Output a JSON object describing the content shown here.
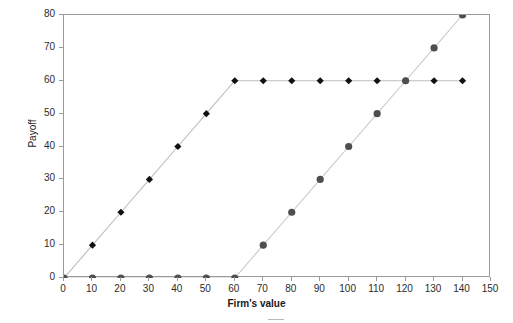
{
  "chart_data": {
    "type": "line",
    "title": "",
    "xlabel": "Firm's value",
    "ylabel": "Payoff",
    "xlim": [
      0,
      150
    ],
    "ylim": [
      0,
      80
    ],
    "xticks": [
      0,
      10,
      20,
      30,
      40,
      50,
      60,
      70,
      80,
      90,
      100,
      110,
      120,
      130,
      140,
      150
    ],
    "yticks": [
      0,
      10,
      20,
      30,
      40,
      50,
      60,
      70,
      80
    ],
    "xtick_labels": [
      "0",
      "10",
      "20",
      "30",
      "40",
      "50",
      "60",
      "70",
      "80",
      "90",
      "100",
      "110",
      "120",
      "130",
      "140",
      "150"
    ],
    "ytick_labels": [
      "0",
      "10",
      "20",
      "30",
      "40",
      "50",
      "60",
      "70",
      "80"
    ],
    "grid": false,
    "legend_position": "bottom",
    "series": [
      {
        "name": "Debt payoff",
        "marker": "diamond",
        "marker_color": "#111111",
        "line_color": "#bdbdbd",
        "x": [
          0,
          10,
          20,
          30,
          40,
          50,
          60,
          70,
          80,
          90,
          100,
          110,
          120,
          130,
          140
        ],
        "values": [
          0,
          10,
          20,
          30,
          40,
          50,
          60,
          60,
          60,
          60,
          60,
          60,
          60,
          60,
          60
        ]
      },
      {
        "name": "Equity payoff",
        "marker": "circle",
        "marker_color": "#4e4e4e",
        "line_color": "#c9c9c9",
        "x": [
          0,
          10,
          20,
          30,
          40,
          50,
          60,
          70,
          80,
          90,
          100,
          110,
          120,
          130,
          140
        ],
        "values": [
          0,
          0,
          0,
          0,
          0,
          0,
          0,
          10,
          20,
          30,
          40,
          50,
          60,
          70,
          80
        ]
      }
    ],
    "annotations": []
  },
  "colors": {
    "axis": "#9a9a9a",
    "text": "#2b2b2b",
    "background": "#ffffff"
  }
}
